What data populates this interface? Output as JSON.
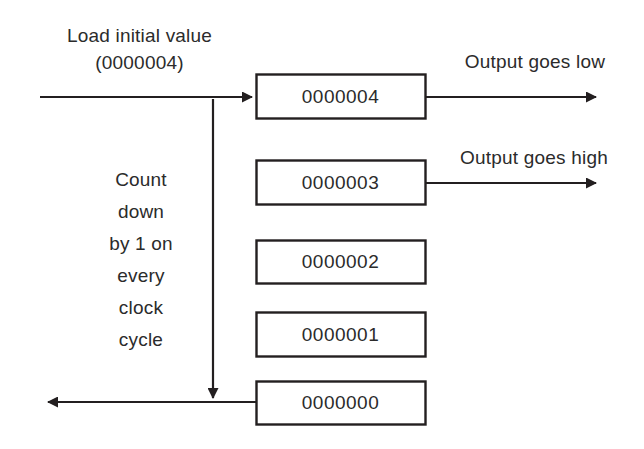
{
  "diagram": {
    "stroke_color": "#231f20",
    "text_color": "#2b2b2b",
    "background_color": "#ffffff",
    "labels": {
      "load_line1": "Load initial value",
      "load_line2": "(0000004)",
      "output_low": "Output goes low",
      "output_high": "Output goes high",
      "count_text": "Count\ndown\nby 1 on\nevery\nclock\ncycle",
      "count_lines": [
        "Count",
        "down",
        "by 1 on",
        "every",
        "clock",
        "cycle"
      ]
    },
    "boxes": [
      {
        "value": "0000004",
        "x": 256,
        "y": 74,
        "w": 169,
        "h": 44
      },
      {
        "value": "0000003",
        "x": 256,
        "y": 160,
        "w": 169,
        "h": 44
      },
      {
        "value": "0000002",
        "x": 256,
        "y": 240,
        "w": 169,
        "h": 43
      },
      {
        "value": "0000001",
        "x": 256,
        "y": 312,
        "w": 169,
        "h": 44
      },
      {
        "value": "0000000",
        "x": 256,
        "y": 381,
        "w": 169,
        "h": 43
      }
    ],
    "arrows": [
      {
        "name": "load-input-arrow",
        "direction": "right",
        "from_x": 40,
        "to_x": 256,
        "y": 97
      },
      {
        "name": "output-low-arrow",
        "direction": "right",
        "from_x": 425,
        "to_x": 600,
        "y": 97
      },
      {
        "name": "output-high-arrow",
        "direction": "right",
        "from_x": 425,
        "to_x": 600,
        "y": 183
      },
      {
        "name": "count-down-arrow",
        "direction": "down",
        "x": 213,
        "from_y": 101,
        "to_y": 402
      },
      {
        "name": "wrap-around-arrow",
        "direction": "left",
        "from_x": 256,
        "to_x": 44,
        "y": 402
      }
    ]
  }
}
